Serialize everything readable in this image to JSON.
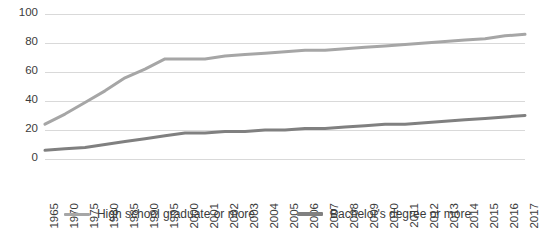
{
  "chart_data": {
    "type": "line",
    "title": "",
    "subtitle": "",
    "xlabel": "",
    "ylabel": "",
    "ylim": [
      0,
      100
    ],
    "yticks": [
      0,
      20,
      40,
      60,
      80,
      100
    ],
    "grid": true,
    "legend_position": "bottom",
    "categories": [
      "1965",
      "1970",
      "1975",
      "1980",
      "1985",
      "1990",
      "1995",
      "2000",
      "2001",
      "2002",
      "2003",
      "2004",
      "2005",
      "2006",
      "2007",
      "2008",
      "2009",
      "2010",
      "2011",
      "2012",
      "2013",
      "2014",
      "2015",
      "2016",
      "2017"
    ],
    "series": [
      {
        "name": "High school graduate or more",
        "color": "#a6a6a6",
        "values": [
          24,
          31,
          39,
          47,
          56,
          62,
          69,
          69,
          69,
          71,
          72,
          73,
          74,
          75,
          75,
          76,
          77,
          78,
          79,
          80,
          81,
          82,
          83,
          85,
          86
        ]
      },
      {
        "name": "Bachelor's degree or more",
        "color": "#808080",
        "values": [
          6,
          7,
          8,
          10,
          12,
          14,
          16,
          18,
          18,
          19,
          19,
          20,
          20,
          21,
          21,
          22,
          23,
          24,
          24,
          25,
          26,
          27,
          28,
          29,
          30
        ]
      }
    ]
  },
  "legend": {
    "entries": [
      {
        "label": "High school graduate or more"
      },
      {
        "label": "Bachelor's degree or more"
      }
    ]
  },
  "axis": {
    "y_tick_labels": [
      "100",
      "80",
      "60",
      "40",
      "20",
      "0"
    ],
    "x_tick_labels": [
      "1965",
      "1970",
      "1975",
      "1980",
      "1985",
      "1990",
      "1995",
      "2000",
      "2001",
      "2002",
      "2003",
      "2004",
      "2005",
      "2006",
      "2007",
      "2008",
      "2009",
      "2010",
      "2011",
      "2012",
      "2013",
      "2014",
      "2015",
      "2016",
      "2017"
    ]
  },
  "colors": {
    "grid": "#d9d9d9",
    "text": "#3b3b3b",
    "series_high_school": "#a6a6a6",
    "series_bachelors": "#808080",
    "background": "#ffffff"
  }
}
